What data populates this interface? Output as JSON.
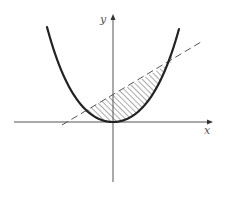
{
  "figure": {
    "width": 228,
    "height": 209,
    "background": "#ffffff"
  },
  "axes": {
    "x_label": "x",
    "y_label": "y",
    "origin_px": [
      113,
      122
    ],
    "x_axis_px": {
      "from": 14,
      "to": 212
    },
    "y_axis_px": {
      "from": 182,
      "to": 15
    },
    "color": "#555555"
  },
  "curve": {
    "name": "parabola",
    "style": "solid",
    "color": "#222222",
    "stroke_width": 2.2,
    "vertex_px": [
      113,
      122
    ],
    "left_end_px": [
      47,
      27
    ],
    "right_end_px": [
      179,
      29
    ]
  },
  "line": {
    "name": "secant-line",
    "style": "dashed",
    "color": "#555555",
    "start_px": [
      62,
      125
    ],
    "end_px": [
      201,
      42
    ]
  },
  "shaded_region": {
    "description": "region between the dashed line and the parabola",
    "pattern": "diagonal-hatch",
    "left_intersection_px": [
      86,
      110
    ],
    "right_intersection_px": [
      172,
      62
    ],
    "color": "#444444"
  }
}
